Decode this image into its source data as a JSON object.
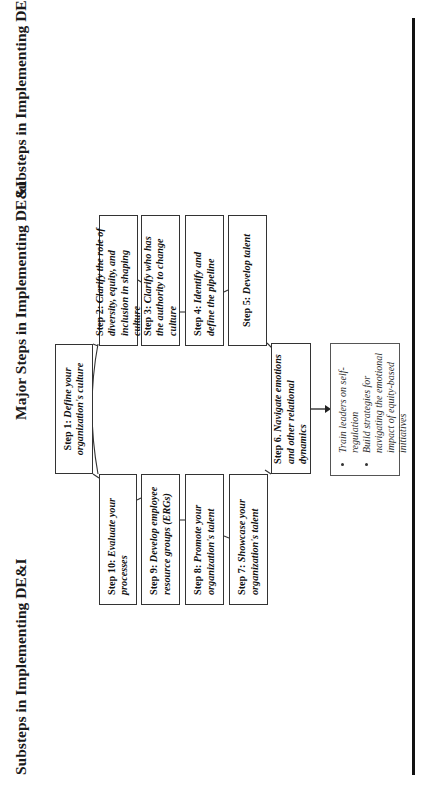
{
  "titles": {
    "left": "Substeps in Implementing DE&I",
    "center": "Major Steps in Implementing DE&I",
    "right": "Substeps in Implementing DE&I"
  },
  "steps": [
    {
      "label": "Step 1:",
      "text": "Define your organization's culture"
    },
    {
      "label": "Step 2:",
      "text": "Clarify the role of diversity, equity, and inclusion in shaping culture"
    },
    {
      "label": "Step 3:",
      "text": "Clarify who has the authority to change culture"
    },
    {
      "label": "Step 4:",
      "text": "Identify and define the pipeline"
    },
    {
      "label": "Step 5:",
      "text": "Develop talent"
    },
    {
      "label": "Step 6.",
      "text": "Navigate emotions and other relational dynamics"
    },
    {
      "label": "Step 7:",
      "text": "Showcase your organization's talent"
    },
    {
      "label": "Step 8:",
      "text": "Promote your organization's talent"
    },
    {
      "label": "Step 9:",
      "text": "Develop employee resource groups (ERGs)"
    },
    {
      "label": "Step 10:",
      "text": "Evaluate your processes"
    }
  ],
  "substeps": {
    "step6": [
      "Train leaders on self-regulation",
      "Build strategies for navigating the emotional impact of equity-based initiatives"
    ]
  },
  "colors": {
    "line": "#111111",
    "box_border": "#333333",
    "background": "#ffffff"
  }
}
